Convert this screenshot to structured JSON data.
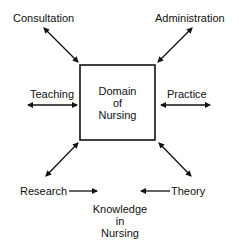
{
  "diagram": {
    "center_box": {
      "lines": [
        "Domain",
        "of",
        "Nursing"
      ]
    },
    "nodes": {
      "consultation": "Consultation",
      "administration": "Administration",
      "teaching": "Teaching",
      "practice": "Practice",
      "research": "Research",
      "theory": "Theory"
    },
    "bottom_label": {
      "lines": [
        "Knowledge",
        "in",
        "Nursing"
      ]
    },
    "edges": [
      {
        "from": "Consultation",
        "to": "Domain of Nursing",
        "type": "bidirectional"
      },
      {
        "from": "Administration",
        "to": "Domain of Nursing",
        "type": "bidirectional"
      },
      {
        "from": "Teaching",
        "to": "Domain of Nursing",
        "type": "bidirectional"
      },
      {
        "from": "Practice",
        "to": "Domain of Nursing",
        "type": "bidirectional"
      },
      {
        "from": "Research",
        "to": "Domain of Nursing",
        "type": "bidirectional"
      },
      {
        "from": "Theory",
        "to": "Domain of Nursing",
        "type": "bidirectional"
      },
      {
        "from": "Research",
        "to": "Knowledge in Nursing",
        "type": "directed"
      },
      {
        "from": "Theory",
        "to": "Knowledge in Nursing",
        "type": "directed"
      }
    ],
    "colors": {
      "ink": "#111111",
      "background": "#ffffff"
    }
  }
}
